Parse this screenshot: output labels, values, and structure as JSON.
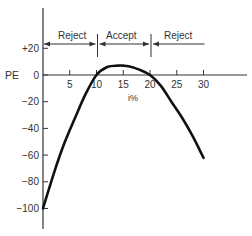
{
  "chart_data": {
    "type": "line",
    "title": "",
    "xlabel": "i%",
    "ylabel": "PE",
    "xlim": [
      0,
      40
    ],
    "ylim": [
      -110,
      35
    ],
    "x_ticks": [
      5,
      10,
      15,
      20,
      25,
      30
    ],
    "x_tick_labels": [
      "5",
      "10",
      "15",
      "20",
      "25",
      "30"
    ],
    "y_ticks": [
      20,
      0,
      -20,
      -40,
      -60,
      -80,
      -100
    ],
    "y_tick_labels": [
      "+20",
      "0",
      "−20",
      "−40",
      "−60",
      "−80",
      "−100"
    ],
    "grid": false,
    "legend": null,
    "series": [
      {
        "name": "PE vs i%",
        "x": [
          0,
          2,
          4,
          6,
          8,
          10,
          12,
          14,
          15,
          16,
          18,
          20,
          22,
          24,
          26,
          28,
          30
        ],
        "y": [
          -100,
          -74,
          -51,
          -32,
          -14,
          0,
          6,
          7,
          7,
          6.5,
          4,
          0,
          -8,
          -20,
          -32,
          -46,
          -62
        ]
      }
    ],
    "annotations": [
      {
        "label": "Reject",
        "from": 0,
        "to": 10,
        "arrows": "both"
      },
      {
        "label": "Accept",
        "from": 10,
        "to": 20,
        "arrows": "both"
      },
      {
        "label": "Reject",
        "from": 20,
        "to": 30,
        "arrows": "left"
      }
    ],
    "region_dividers_x": [
      10,
      20
    ]
  },
  "labels": {
    "y_axis": "PE",
    "x_axis": "i%",
    "region_left": "Reject",
    "region_middle": "Accept",
    "region_right": "Reject"
  },
  "colors": {
    "curve": "#111111",
    "axis": "#333333",
    "text": "#333333"
  }
}
